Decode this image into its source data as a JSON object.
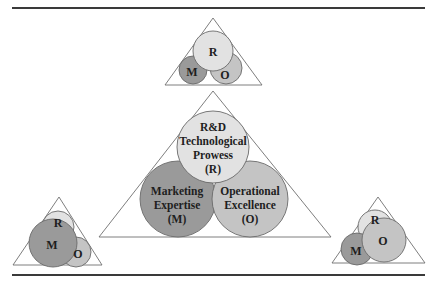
{
  "diagram": {
    "colors": {
      "R": "#e2e2e2",
      "M": "#9a9a9a",
      "O": "#c4c4c4",
      "outline": "#6f6f6f",
      "rule": "#3a3a3a"
    },
    "main": {
      "R": {
        "line1": "R&D",
        "line2": "Technological",
        "line3": "Prowess",
        "line4": "(R)"
      },
      "M": {
        "line1": "Marketing",
        "line2": "Expertise",
        "line3": "(M)"
      },
      "O": {
        "line1": "Operational",
        "line2": "Excellence",
        "line3": "(O)"
      }
    },
    "top": {
      "R": "R",
      "M": "M",
      "O": "O",
      "emphasis": "R"
    },
    "bottom_left": {
      "R": "R",
      "M": "M",
      "O": "O",
      "emphasis": "M"
    },
    "bottom_right": {
      "R": "R",
      "M": "M",
      "O": "O",
      "emphasis": "O"
    }
  }
}
